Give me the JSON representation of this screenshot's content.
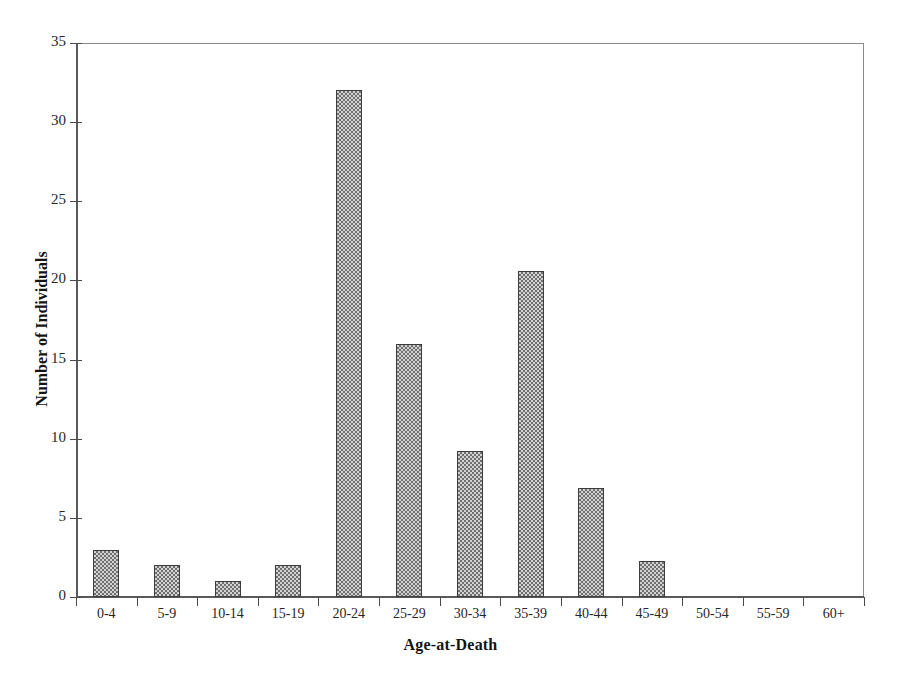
{
  "chart_data": {
    "type": "bar",
    "title": "",
    "subtitle": "",
    "xlabel": "Age-at-Death",
    "ylabel": "Number of Individuals",
    "categories": [
      "0-4",
      "5-9",
      "10-14",
      "15-19",
      "20-24",
      "25-29",
      "30-34",
      "35-39",
      "40-44",
      "45-49",
      "50-54",
      "55-59",
      "60+"
    ],
    "values": [
      3,
      2,
      1,
      2,
      32,
      16,
      9.2,
      20.6,
      6.9,
      2.3,
      0,
      0,
      0
    ],
    "ylim": [
      0,
      35
    ],
    "yticks": [
      0,
      5,
      10,
      15,
      20,
      25,
      30,
      35
    ],
    "ytick_labels": [
      "0",
      "5",
      "10",
      "15",
      "20",
      "25",
      "30",
      "35"
    ],
    "grid": false,
    "legend": null,
    "bar_color": "#a8a8a8",
    "bar_edge_color": "#3d3d3d",
    "axis_color": "#5a5a5a",
    "background": "#ffffff"
  }
}
